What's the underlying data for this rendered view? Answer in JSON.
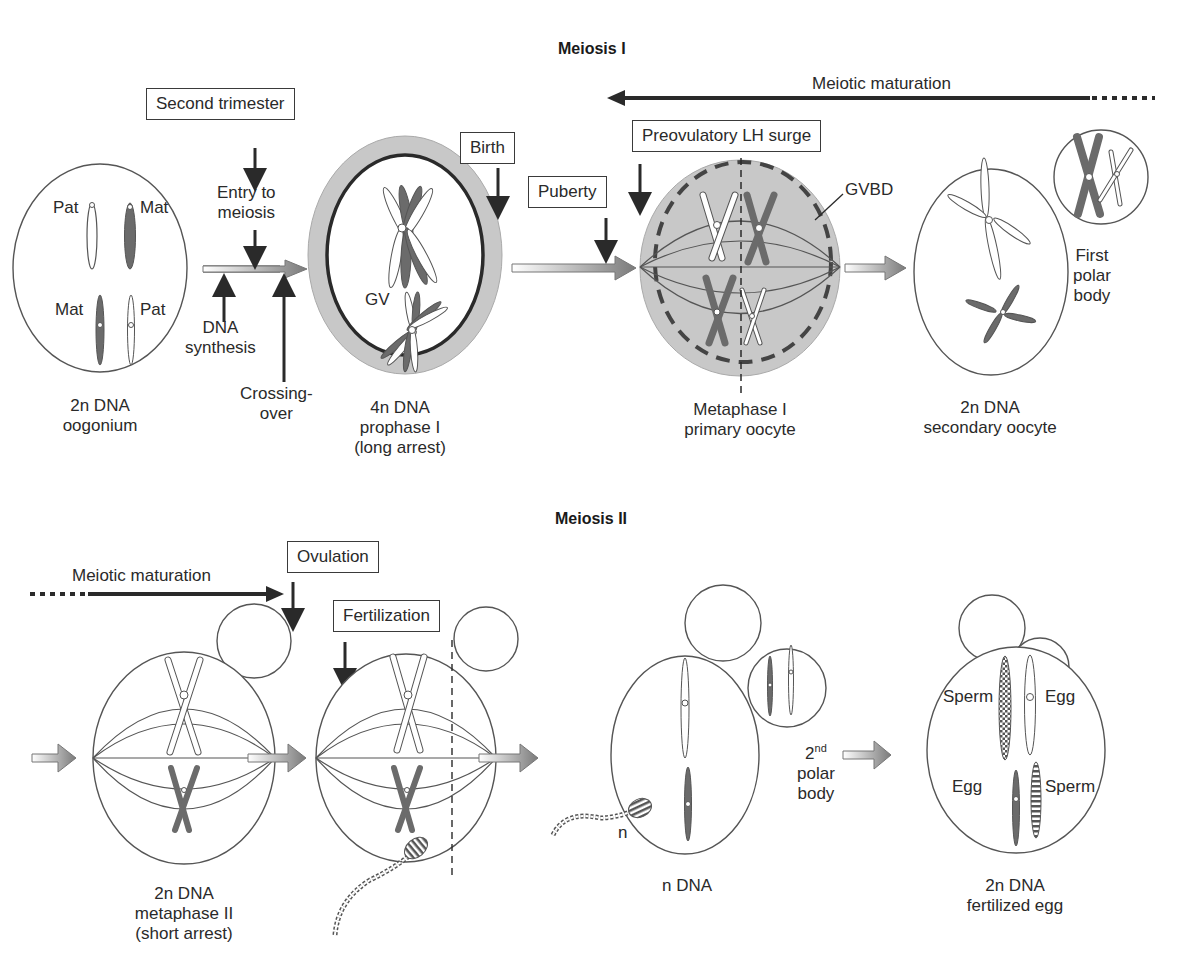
{
  "meiosis_1": {
    "title": "Meiosis I",
    "meiotic_maturation": "Meiotic maturation",
    "events": {
      "second_trimester": "Second trimester",
      "birth": "Birth",
      "puberty": "Puberty",
      "lh_surge": "Preovulatory LH surge"
    },
    "annotations": {
      "entry_to_meiosis_1": "Entry to",
      "entry_to_meiosis_2": "meiosis",
      "dna_synthesis_1": "DNA",
      "dna_synthesis_2": "synthesis",
      "crossing_over_1": "Crossing-",
      "crossing_over_2": "over",
      "gv": "GV",
      "gvbd": "GVBD",
      "pat_top": "Pat",
      "mat_top": "Mat",
      "mat_bottom": "Mat",
      "pat_bottom": "Pat",
      "first_polar_body_1": "First",
      "first_polar_body_2": "polar",
      "first_polar_body_3": "body"
    },
    "stages": [
      {
        "line1": "2n DNA",
        "line2": "oogonium",
        "line3": ""
      },
      {
        "line1": "4n DNA",
        "line2": "prophase I",
        "line3": "(long arrest)"
      },
      {
        "line1": "Metaphase I",
        "line2": "primary oocyte",
        "line3": ""
      },
      {
        "line1": "2n DNA",
        "line2": "secondary oocyte",
        "line3": ""
      }
    ]
  },
  "meiosis_2": {
    "title": "Meiosis II",
    "meiotic_maturation": "Meiotic maturation",
    "events": {
      "ovulation": "Ovulation",
      "fertilization": "Fertilization"
    },
    "annotations": {
      "n": "n",
      "second_polar_body_num": "2",
      "second_polar_body_sup": "nd",
      "second_polar_body_2": "polar",
      "second_polar_body_3": "body",
      "sperm_top": "Sperm",
      "egg_top": "Egg",
      "egg_bottom": "Egg",
      "sperm_bottom": "Sperm"
    },
    "stages": [
      {
        "line1": "2n DNA",
        "line2": "metaphase II",
        "line3": "(short arrest)"
      },
      {
        "line1": "n DNA",
        "line2": "",
        "line3": ""
      },
      {
        "line1": "2n DNA",
        "line2": "fertilized egg",
        "line3": ""
      }
    ]
  },
  "colors": {
    "line": "#4a4a4a",
    "dark_chromosome": "#6b6b6b",
    "zona_gray": "#c8c8c8",
    "arrow_gray": "#8a8a8a"
  }
}
